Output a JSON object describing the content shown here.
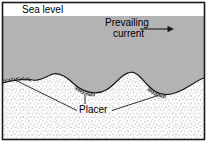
{
  "figure": {
    "kind": "geologic-cross-section",
    "title_labels": {
      "sea_level": "Sea level",
      "prevailing_current_line1": "Prevailing",
      "prevailing_current_line2": "current",
      "placer": "Placer"
    },
    "colors": {
      "frame": "#1a1a1a",
      "water": "#b3b3b3",
      "sediment_fill": "#fbfbfb",
      "sediment_stipple": "#555555",
      "placer_stipple": "#2e2e2e",
      "placer_tone": "#9a9a9a",
      "leader_line": "#111111",
      "page_background": "#ffffff",
      "sky_band": "#ffffff"
    },
    "geometry": {
      "frame": {
        "x": 2,
        "y": 2,
        "width": 203,
        "height": 138
      },
      "sea_level_y": 16,
      "seafloor_crests_x": [
        52,
        130
      ],
      "seafloor_troughs_x": [
        95,
        166
      ],
      "arrow": {
        "x1": 140,
        "y1": 29,
        "x2": 173,
        "y2": 29,
        "direction": "right"
      }
    },
    "annotations": [
      {
        "name": "sea-level-label",
        "text": "Sea level",
        "x": 22,
        "y": 13
      },
      {
        "name": "prevailing-current-label",
        "text": "Prevailing current",
        "x": 105,
        "y": 26
      },
      {
        "name": "placer-label",
        "text": "Placer",
        "x": 79,
        "y": 112
      }
    ]
  }
}
